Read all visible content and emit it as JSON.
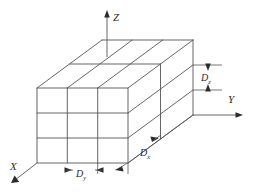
{
  "figure": {
    "background_color": "#ffffff",
    "line_color": "#555555",
    "text_color": "#2b2b2b"
  },
  "axes": [
    {
      "key": "z",
      "label": "Z",
      "direction": "up"
    },
    {
      "key": "y",
      "label": "Y",
      "direction": "right"
    },
    {
      "key": "x",
      "label": "X",
      "direction": "lower-left"
    }
  ],
  "axis_labels": {
    "z": "Z",
    "y": "Y",
    "x": "X"
  },
  "dimensions": [
    {
      "key": "dz",
      "base": "D",
      "subscript": "z",
      "label": "Dz",
      "orientation": "vertical",
      "measures": "cell height along Z"
    },
    {
      "key": "dy",
      "base": "D",
      "subscript": "y",
      "label": "Dy",
      "orientation": "horizontal",
      "measures": "cell width along Y"
    },
    {
      "key": "dx",
      "base": "D",
      "subscript": "x",
      "label": "Dx",
      "orientation": "oblique",
      "measures": "cell depth along X"
    }
  ],
  "dimension_labels": {
    "dz_base": "D",
    "dz_sub": "z",
    "dy_base": "D",
    "dy_sub": "y",
    "dx_base": "D",
    "dx_sub": "x"
  },
  "grid": {
    "type": "rectangular-block",
    "projection": "oblique",
    "cells_along_y": 3,
    "cells_along_z": 3,
    "cells_along_x": 2,
    "front_face_rows": 3,
    "front_face_cols": 3,
    "side_face_rows": 3,
    "side_face_cols": 2,
    "top_face_rows": 2,
    "top_face_cols": 3
  }
}
